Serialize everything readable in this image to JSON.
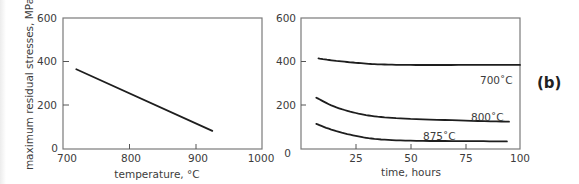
{
  "panel_label": "(b)",
  "chart_data": [
    {
      "type": "line",
      "title": "",
      "xlabel": "temperature, °C",
      "ylabel": "maximum residual stresses, MPa",
      "xlim": [
        700,
        1000
      ],
      "ylim": [
        0,
        600
      ],
      "xticks": [
        "700",
        "800",
        "900",
        "1000"
      ],
      "yticks": [
        "0",
        "200",
        "400",
        "600"
      ],
      "grid": false,
      "series": [
        {
          "name": "max residual stress",
          "x": [
            720,
            925
          ],
          "y": [
            365,
            83
          ]
        }
      ]
    },
    {
      "type": "line",
      "title": "",
      "xlabel": "time, hours",
      "ylabel": "",
      "xlim": [
        0,
        100
      ],
      "ylim": [
        0,
        600
      ],
      "xticks": [
        "0",
        "25",
        "50",
        "75",
        "100"
      ],
      "yticks": [
        "0",
        "200",
        "400",
        "600"
      ],
      "grid": false,
      "series": [
        {
          "name": "700˚C",
          "x": [
            8,
            15,
            25,
            35,
            50,
            75,
            100
          ],
          "y": [
            415,
            405,
            395,
            388,
            385,
            385,
            385
          ]
        },
        {
          "name": "800˚C",
          "x": [
            7,
            15,
            25,
            35,
            50,
            75,
            95
          ],
          "y": [
            235,
            195,
            165,
            148,
            138,
            130,
            125
          ]
        },
        {
          "name": "875˚C",
          "x": [
            7,
            15,
            25,
            35,
            50,
            75,
            94
          ],
          "y": [
            115,
            85,
            60,
            45,
            38,
            36,
            35
          ]
        }
      ]
    }
  ],
  "left_plot": {
    "xlabel": "temperature,  °C",
    "ylabel": "maximum residual stresses, MPa",
    "xticks": [
      "700",
      "800",
      "900",
      "1000"
    ],
    "yticks": [
      "0",
      "200",
      "400",
      "600"
    ]
  },
  "right_plot": {
    "xlabel": "time, hours",
    "xticks": [
      "25",
      "50",
      "75",
      "100"
    ],
    "yticks": [
      "0",
      "200",
      "400",
      "600"
    ],
    "curve_labels": [
      "700˚C",
      "800˚C",
      "875˚C"
    ]
  }
}
